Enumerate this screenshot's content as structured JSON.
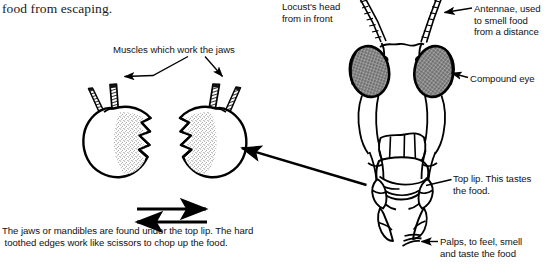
{
  "page": {
    "width": 548,
    "height": 265,
    "background": "#ffffff",
    "ink": "#000000",
    "type": "labelled biology diagram"
  },
  "body_text": {
    "continuation_line": "food from escaping.",
    "jaws_caption": "The jaws or mandibles are found under the top lip. The hard\n toothed edges work like scissors to chop up the food."
  },
  "labels": {
    "muscles": "Muscles which work the jaws",
    "locust_head": "Locust's head\nfrom in front",
    "antennae": "Antennae, used\nto smell food\nfrom a distance",
    "compound_eye": "Compound eye",
    "top_lip": "Top lip. This tastes\nthe food.",
    "palps": "Palps, to feel, smell\nand taste the food"
  },
  "figures": {
    "mandibles": {
      "name": "pair-of-mandibles-diagram",
      "description": "Left and right mandible (jaw) each with two muscle bundles on top and stippled toothed cutting edge facing inward",
      "motion_arrows": [
        "right-pointing-arrow",
        "left-pointing-arrow"
      ]
    },
    "locust_head": {
      "name": "locust-head-front-view-diagram",
      "description": "Front view of a locust head showing two antennae, two compound eyes, top lip (labrum) and palps"
    }
  },
  "leader_lines": [
    {
      "from": "muscles-label",
      "to": "left-jaw-muscle"
    },
    {
      "from": "muscles-label",
      "to": "right-jaw-muscle"
    },
    {
      "from": "locust-head-mandible-region",
      "to": "right-mandible-diagram"
    },
    {
      "from": "antennae-label",
      "to": "right-antenna"
    },
    {
      "from": "compound-eye-label",
      "to": "right-compound-eye"
    },
    {
      "from": "top-lip-label",
      "to": "top-lip"
    },
    {
      "from": "palps-label",
      "to": "palps"
    }
  ]
}
